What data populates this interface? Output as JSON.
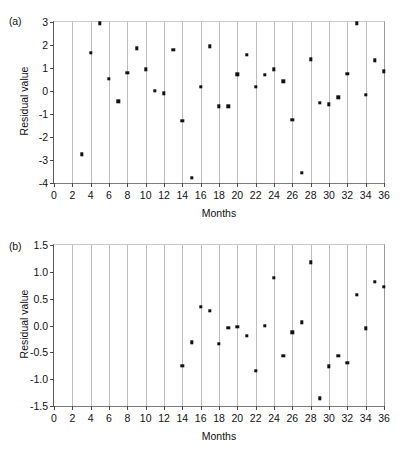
{
  "figure": {
    "panel_a_label": "(a)",
    "panel_b_label": "(b)"
  },
  "chart_data": [
    {
      "type": "scatter",
      "panel": "(a)",
      "title": "",
      "xlabel": "Months",
      "ylabel": "Residual value",
      "xlim": [
        0,
        36
      ],
      "ylim": [
        -4,
        3
      ],
      "xticks": [
        0,
        2,
        4,
        6,
        8,
        10,
        12,
        14,
        16,
        18,
        20,
        22,
        24,
        26,
        28,
        30,
        32,
        34,
        36
      ],
      "xticklabels": [
        "0",
        "2",
        "4",
        "6",
        "8",
        "10",
        "12",
        "14",
        "16",
        "18",
        "20",
        "22",
        "24",
        "26",
        "28",
        "30",
        "32",
        "34",
        "36"
      ],
      "yticks": [
        3,
        2,
        1,
        0,
        -1,
        -2,
        -3,
        -4
      ],
      "yticklabels": [
        "3",
        "2",
        "1",
        "0",
        "-1",
        "-2",
        "-3",
        "-4"
      ],
      "grid": "vertical",
      "gridlines_x": [
        2,
        4,
        6,
        8,
        10,
        12,
        14,
        16,
        18,
        20,
        22,
        24,
        26,
        28,
        30,
        32,
        34
      ],
      "legend": null,
      "marker": "square",
      "marker_color": "#111111",
      "x": [
        3,
        4,
        5,
        6,
        7,
        8,
        9,
        10,
        11,
        12,
        13,
        14,
        15,
        16,
        17,
        18,
        19,
        20,
        21,
        22,
        23,
        24,
        25,
        26,
        27,
        28,
        29,
        30,
        31,
        32,
        33,
        34,
        35,
        36
      ],
      "y": [
        -2.75,
        1.65,
        2.95,
        0.52,
        -0.45,
        0.8,
        1.85,
        0.95,
        0.0,
        -0.1,
        1.8,
        -1.3,
        -3.78,
        0.18,
        1.95,
        -0.67,
        -0.67,
        0.72,
        1.58,
        0.18,
        0.7,
        0.95,
        0.42,
        -1.25,
        -3.55,
        1.38,
        -0.52,
        -0.57,
        -0.27,
        0.75,
        2.95,
        -0.17,
        1.33,
        0.85
      ]
    },
    {
      "type": "scatter",
      "panel": "(b)",
      "title": "",
      "xlabel": "Months",
      "ylabel": "Residual value",
      "xlim": [
        0,
        36
      ],
      "ylim": [
        -1.5,
        1.5
      ],
      "xticks": [
        0,
        2,
        4,
        6,
        8,
        10,
        12,
        14,
        16,
        18,
        20,
        22,
        24,
        26,
        28,
        30,
        32,
        34,
        36
      ],
      "xticklabels": [
        "0",
        "2",
        "4",
        "6",
        "8",
        "10",
        "12",
        "14",
        "16",
        "18",
        "20",
        "22",
        "24",
        "26",
        "28",
        "30",
        "32",
        "34",
        "36"
      ],
      "yticks": [
        1.5,
        1.0,
        0.5,
        0.0,
        -0.5,
        -1.0,
        -1.5
      ],
      "yticklabels": [
        "1.5",
        "1.0",
        "0.5",
        "0.0",
        "-0.5",
        "-1.0",
        "-1.5"
      ],
      "grid": "vertical",
      "gridlines_x": [
        2,
        4,
        6,
        8,
        10,
        12,
        14,
        16,
        18,
        20,
        22,
        24,
        26,
        28,
        30,
        32,
        34
      ],
      "legend": null,
      "marker": "square",
      "marker_color": "#111111",
      "x": [
        14,
        15,
        16,
        17,
        18,
        19,
        20,
        21,
        22,
        23,
        24,
        25,
        26,
        27,
        28,
        29,
        30,
        31,
        32,
        33,
        34,
        35,
        36
      ],
      "y": [
        -0.75,
        -0.31,
        0.35,
        0.27,
        -0.34,
        -0.04,
        -0.02,
        -0.19,
        -0.84,
        0.0,
        0.89,
        -0.56,
        -0.13,
        0.06,
        1.18,
        -1.36,
        -0.76,
        -0.56,
        -0.69,
        0.57,
        -0.05,
        0.81,
        0.72
      ]
    }
  ]
}
